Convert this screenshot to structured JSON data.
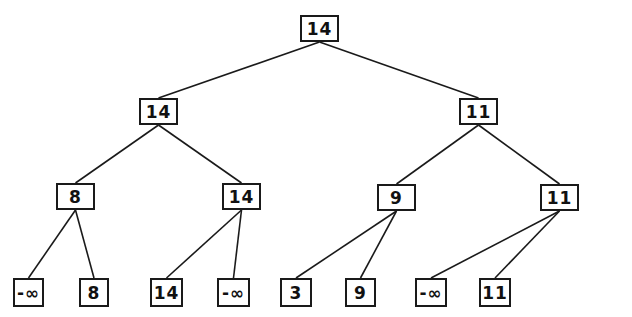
{
  "tree": {
    "nodes": [
      {
        "id": "root",
        "value": "14",
        "x": 300,
        "y": 15,
        "w": 39,
        "h": 27
      },
      {
        "id": "l1a",
        "value": "14",
        "x": 139,
        "y": 98,
        "w": 39,
        "h": 27
      },
      {
        "id": "l1b",
        "value": "11",
        "x": 459,
        "y": 98,
        "w": 39,
        "h": 27
      },
      {
        "id": "l2a",
        "value": "8",
        "x": 56,
        "y": 183,
        "w": 39,
        "h": 27
      },
      {
        "id": "l2b",
        "value": "14",
        "x": 222,
        "y": 183,
        "w": 39,
        "h": 27
      },
      {
        "id": "l2c",
        "value": "9",
        "x": 377,
        "y": 184,
        "w": 39,
        "h": 27
      },
      {
        "id": "l2d",
        "value": "11",
        "x": 540,
        "y": 184,
        "w": 39,
        "h": 27
      },
      {
        "id": "leaf1",
        "value": "-∞",
        "x": 13,
        "y": 278,
        "w": 31,
        "h": 29
      },
      {
        "id": "leaf2",
        "value": "8",
        "x": 79,
        "y": 278,
        "w": 30,
        "h": 29
      },
      {
        "id": "leaf3",
        "value": "14",
        "x": 150,
        "y": 278,
        "w": 33,
        "h": 29
      },
      {
        "id": "leaf4",
        "value": "-∞",
        "x": 217,
        "y": 278,
        "w": 33,
        "h": 29
      },
      {
        "id": "leaf5",
        "value": "3",
        "x": 280,
        "y": 278,
        "w": 32,
        "h": 29
      },
      {
        "id": "leaf6",
        "value": "9",
        "x": 345,
        "y": 278,
        "w": 31,
        "h": 29
      },
      {
        "id": "leaf7",
        "value": "-∞",
        "x": 415,
        "y": 278,
        "w": 32,
        "h": 29
      },
      {
        "id": "leaf8",
        "value": "11",
        "x": 479,
        "y": 278,
        "w": 32,
        "h": 29
      }
    ],
    "edges": [
      [
        "root",
        "l1a"
      ],
      [
        "root",
        "l1b"
      ],
      [
        "l1a",
        "l2a"
      ],
      [
        "l1a",
        "l2b"
      ],
      [
        "l1b",
        "l2c"
      ],
      [
        "l1b",
        "l2d"
      ],
      [
        "l2a",
        "leaf1"
      ],
      [
        "l2a",
        "leaf2"
      ],
      [
        "l2b",
        "leaf3"
      ],
      [
        "l2b",
        "leaf4"
      ],
      [
        "l2c",
        "leaf5"
      ],
      [
        "l2c",
        "leaf6"
      ],
      [
        "l2d",
        "leaf7"
      ],
      [
        "l2d",
        "leaf8"
      ]
    ]
  },
  "caption": "The tournament tree (winner tree) with maximum values"
}
